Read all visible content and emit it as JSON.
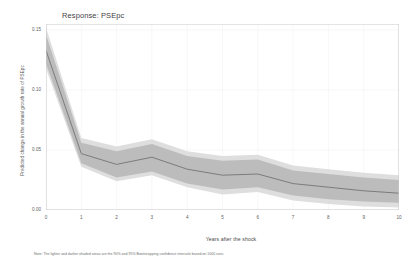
{
  "chart_data": {
    "type": "line",
    "title": "Response: PSEpc",
    "xlabel": "Years after the shock",
    "ylabel": "Predicted change in the annual growth rate of PSEpc",
    "x": [
      0,
      1,
      2,
      3,
      4,
      5,
      6,
      7,
      8,
      9,
      10
    ],
    "xlim": [
      0,
      10
    ],
    "ylim": [
      0.0,
      0.155
    ],
    "xticks": [
      "0",
      "1",
      "2",
      "3",
      "4",
      "5",
      "6",
      "7",
      "8",
      "9",
      "10"
    ],
    "yticks": [
      "0.00",
      "0.05",
      "0.10",
      "0.15"
    ],
    "ytick_values": [
      0.0,
      0.05,
      0.1,
      0.15
    ],
    "grid": true,
    "legend": "none",
    "series": [
      {
        "name": "Predicted change in the annual growth rate of PSEpc",
        "values": [
          0.133,
          0.047,
          0.038,
          0.044,
          0.034,
          0.029,
          0.03,
          0.022,
          0.019,
          0.016,
          0.014
        ]
      }
    ],
    "bands": [
      {
        "name": "95% bootstrapping confidence interval",
        "level": "95%",
        "color": "#dedede",
        "lower": [
          0.118,
          0.036,
          0.024,
          0.029,
          0.019,
          0.013,
          0.015,
          0.008,
          0.005,
          0.003,
          0.002
        ],
        "upper": [
          0.152,
          0.06,
          0.053,
          0.059,
          0.049,
          0.045,
          0.046,
          0.037,
          0.034,
          0.031,
          0.029
        ]
      },
      {
        "name": "90% bootstrapping confidence interval",
        "level": "90%",
        "color": "#bcbcbc",
        "lower": [
          0.122,
          0.039,
          0.027,
          0.032,
          0.022,
          0.017,
          0.019,
          0.012,
          0.009,
          0.007,
          0.006
        ],
        "upper": [
          0.146,
          0.056,
          0.049,
          0.055,
          0.045,
          0.041,
          0.042,
          0.033,
          0.03,
          0.027,
          0.025
        ]
      }
    ],
    "line_color": "#6b6b6b",
    "footnote": "Note: The lighter and darker shaded areas are the 90% and 95% Bootstrapping confidence intervals based on 1000 runs."
  }
}
